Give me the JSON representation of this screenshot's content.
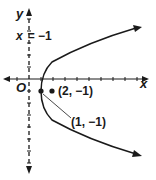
{
  "diagram": {
    "type": "parabola-graph",
    "axes": {
      "x_label": "x",
      "y_label": "y",
      "origin_label": "O"
    },
    "directrix": {
      "label_var": "x",
      "label_eq": "= −1",
      "equation": "x = −1"
    },
    "points": [
      {
        "name": "focus",
        "label": "(2, −1)",
        "x": 2,
        "y": -1
      },
      {
        "name": "vertex",
        "label": "(1, −1)",
        "x": 1,
        "y": -1
      }
    ],
    "curve": {
      "opens": "right",
      "vertex": [
        1,
        -1
      ],
      "focus": [
        2,
        -1
      ]
    },
    "colors": {
      "ink": "#1a1a1a",
      "background": "#ffffff"
    }
  }
}
